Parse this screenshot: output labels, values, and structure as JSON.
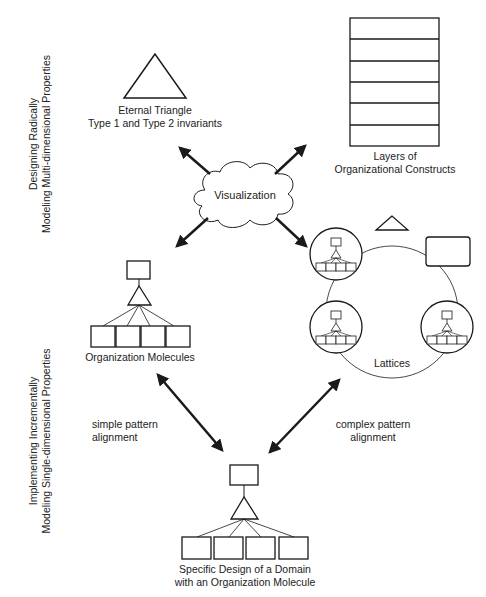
{
  "side_labels": {
    "top": {
      "line1": "Designing Radically",
      "line2": "Modeling Multi-dimensional Properties"
    },
    "bottom": {
      "line1": "Implementing Incrementally",
      "line2": "Modeling Single-dimensional Properties"
    }
  },
  "nodes": {
    "eternal_triangle": {
      "line1": "Eternal Triangle",
      "line2": "Type 1 and Type 2 invariants"
    },
    "layers": {
      "line1": "Layers of",
      "line2": "Organizational Constructs",
      "layer_count": 6
    },
    "visualization": {
      "label": "Visualization"
    },
    "org_molecules": {
      "label": "Organization Molecules"
    },
    "lattices": {
      "label": "Lattices"
    },
    "specific_design": {
      "line1": "Specific Design of a Domain",
      "line2": "with an Organization Molecule"
    }
  },
  "edges": {
    "simple": {
      "line1": "simple pattern",
      "line2": "alignment"
    },
    "complex": {
      "line1": "complex pattern",
      "line2": "alignment"
    }
  },
  "colors": {
    "stroke": "#1a1a1a",
    "background": "#ffffff"
  }
}
